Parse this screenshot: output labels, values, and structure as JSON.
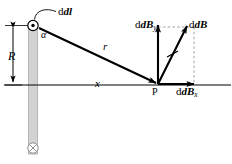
{
  "figure": {
    "colors": {
      "stroke": "#000000",
      "wire_fill": "#cfcfcf",
      "wire_edge": "#9a9a9a",
      "dashed": "#9a9a9a",
      "background": "#ffffff"
    }
  },
  "labels": {
    "current_element": "dl",
    "angle": "α",
    "radius_R": "R",
    "distance_r": "r",
    "distance_x": "x",
    "point_P": "P",
    "field_y_component": "dB",
    "field_y_subscript": "y",
    "field_total": "dB",
    "field_x_component": "dB",
    "field_x_subscript": "x"
  },
  "icons": {
    "current_out_of_page": "circle-dot-icon",
    "current_into_page": "circle-cross-icon",
    "leader_line": "curved-leader-line",
    "tick_mark": "vector-tick-icon"
  },
  "geometry": {
    "source_point": [
      33,
      25
    ],
    "field_point": [
      158,
      85
    ],
    "axis_y": 85,
    "wire_x": 33,
    "into_page_point": [
      33,
      148
    ]
  }
}
